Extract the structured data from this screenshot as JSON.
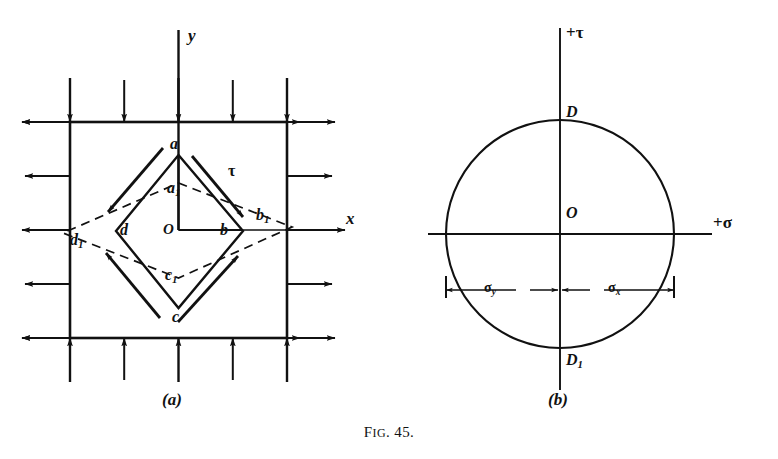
{
  "figure": {
    "caption_prefix": "F",
    "caption_smallcaps": "IG",
    "caption_number": ". 45.",
    "caption_full": "Fig. 45.",
    "ink_color": "#111111",
    "background_color": "#ffffff"
  },
  "panel_a": {
    "label": "(a)",
    "axis_y": "y",
    "axis_x": "x",
    "shear_symbol": "τ",
    "origin": "O",
    "points": [
      {
        "name": "a",
        "base": "a",
        "sub": ""
      },
      {
        "name": "a1",
        "base": "a",
        "sub": "1"
      },
      {
        "name": "b",
        "base": "b",
        "sub": ""
      },
      {
        "name": "b1",
        "base": "b",
        "sub": "1"
      },
      {
        "name": "c",
        "base": "c",
        "sub": ""
      },
      {
        "name": "c1",
        "base": "c",
        "sub": "1"
      },
      {
        "name": "d",
        "base": "d",
        "sub": ""
      },
      {
        "name": "d1",
        "base": "d",
        "sub": "1"
      }
    ],
    "edge_arrows": {
      "top_count": 5,
      "bottom_count": 5,
      "left_count": 5,
      "right_count": 5,
      "top_direction": "down",
      "bottom_direction": "up",
      "left_direction": "left",
      "right_direction": "right"
    },
    "description": "Square element under biaxial stress with inscribed rotated square abcd deformed to a1b1c1d1"
  },
  "panel_b": {
    "label": "(b)",
    "axis_tau": "+τ",
    "axis_sigma": "+σ",
    "origin": "O",
    "top_point": "D",
    "bottom_point_base": "D",
    "bottom_point_sub": "1",
    "dim_left_base": "σ",
    "dim_left_sub": "y",
    "dim_right_base": "σ",
    "dim_right_sub": "x",
    "description": "Mohr's circle of stress centred at O"
  }
}
